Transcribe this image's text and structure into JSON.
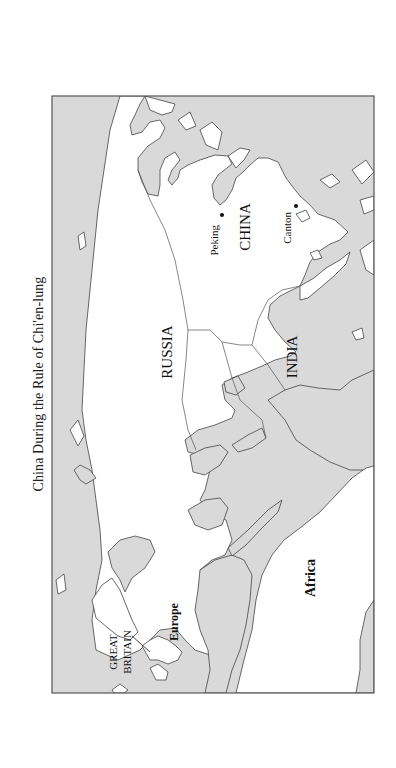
{
  "title": "China During the Rule of Chi'en-lung",
  "colors": {
    "sea": "#d9d9d9",
    "land": "#ffffff",
    "outline": "#444444",
    "frame": "#555555"
  },
  "labels": {
    "russia": "RUSSIA",
    "china": "CHINA",
    "india": "INDIA",
    "europe": "Europe",
    "africa": "Africa",
    "great": "GREAT",
    "britain": "BRITAIN"
  },
  "cities": [
    {
      "name": "Peking"
    },
    {
      "name": "Canton"
    }
  ]
}
